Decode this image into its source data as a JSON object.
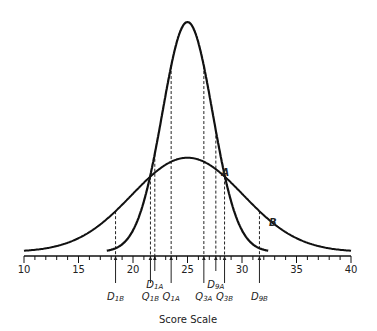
{
  "chart_data": {
    "type": "line",
    "title": "",
    "xlabel": "Score Scale",
    "ylabel": "",
    "xlim": [
      10,
      40
    ],
    "x_ticks": [
      10,
      15,
      20,
      25,
      30,
      35,
      40
    ],
    "x_tick_labels": [
      "10",
      "15",
      "20",
      "25",
      "30",
      "35",
      "40"
    ],
    "minor_tick_step": 1,
    "grid": false,
    "legend": "none (curves labeled inline)",
    "series": [
      {
        "name": "A",
        "distribution": "normal",
        "mean": 25,
        "sd": 2.3,
        "relative_peak_height": 1.0,
        "label_position_x": 28.2
      },
      {
        "name": "B",
        "distribution": "normal",
        "mean": 25,
        "sd": 5.1,
        "relative_peak_height": 0.41,
        "label_position_x": 32.3
      }
    ],
    "markers": [
      {
        "label": "D1B",
        "main": "D",
        "sub": "1B",
        "x": 18.4,
        "row": 2
      },
      {
        "label": "Q1B",
        "main": "Q",
        "sub": "1B",
        "x": 21.6,
        "row": 2
      },
      {
        "label": "D1A",
        "main": "D",
        "sub": "1A",
        "x": 22.0,
        "row": 1
      },
      {
        "label": "Q1A",
        "main": "Q",
        "sub": "1A",
        "x": 23.5,
        "row": 2
      },
      {
        "label": "Q3A",
        "main": "Q",
        "sub": "3A",
        "x": 26.5,
        "row": 2
      },
      {
        "label": "D9A",
        "main": "D",
        "sub": "9A",
        "x": 27.6,
        "row": 1
      },
      {
        "label": "Q3B",
        "main": "Q",
        "sub": "3B",
        "x": 28.4,
        "row": 2
      },
      {
        "label": "D9B",
        "main": "D",
        "sub": "9B",
        "x": 31.6,
        "row": 2
      }
    ]
  }
}
